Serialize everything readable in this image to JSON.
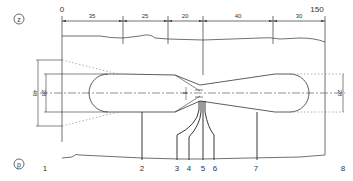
{
  "diagram": {
    "markers": {
      "top": "z",
      "bottom": "p"
    },
    "axis": {
      "start_label": "0",
      "end_label": "150"
    },
    "segments": [
      {
        "label": "35"
      },
      {
        "label": "25"
      },
      {
        "label": "20"
      },
      {
        "label": "40"
      },
      {
        "label": "30"
      }
    ],
    "vertical_dims": {
      "outer_left": "48",
      "inner_left": "28",
      "throat": "5",
      "right": "28"
    },
    "stations": [
      "1",
      "2",
      "3",
      "4",
      "5",
      "6",
      "7",
      "8"
    ]
  }
}
